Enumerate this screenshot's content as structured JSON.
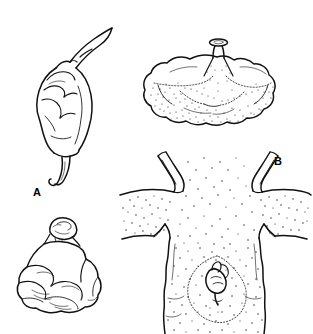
{
  "figure": {
    "name": "four-panel-line-illustration",
    "background_color": "#ffffff",
    "ink_color": "#111111",
    "caption": {
      "visible": false,
      "text": "",
      "note": "top caption line is cropped off at image edge; only faint descender fragments remain"
    },
    "panels": [
      {
        "id": "a",
        "label": "A",
        "subject": "elongate tapering specimen with curved apical stalk and slender basal tail",
        "shading": "outline only with interior contour folds",
        "orientation": "vertical, tilted"
      },
      {
        "id": "b",
        "label": "B",
        "subject": "broad lobed specimen with central erect stalk bearing an oval cap",
        "shading": "stippled lower half with dotted demarcation boundary",
        "orientation": "horizontal, wider than tall"
      },
      {
        "id": "c",
        "label": "C",
        "subject": "rounded lumpy mass with a smaller knob seated on top",
        "shading": "outline only with short hatch creases",
        "orientation": "upright, squat"
      },
      {
        "id": "d",
        "label": "D",
        "subject": "stippled vertical trunk-like section with two pairs of lateral branch stubs and a central bud scar",
        "shading": "dense overall stippling, heaviest at margins",
        "orientation": "vertical panel"
      }
    ]
  },
  "colors": {
    "background": "#ffffff",
    "ink": "#111111",
    "stipple": "#1a1a1a",
    "label": "#000000"
  }
}
